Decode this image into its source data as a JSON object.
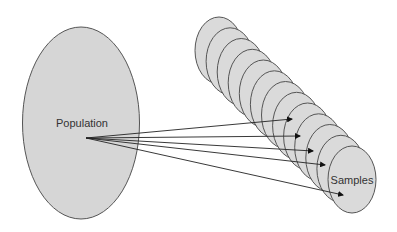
{
  "diagram": {
    "population": {
      "label": "Population",
      "cx": 81,
      "cy": 123,
      "rx": 58.5,
      "ry": 96,
      "fill": "#d6d6d6",
      "stroke": "#555555"
    },
    "samples": {
      "label": "Samples",
      "count": 13,
      "first_center": [
        219,
        50.5
      ],
      "step": [
        11.08,
        10.75
      ],
      "rx": 24,
      "ry": 33.5,
      "fill": "#dadada",
      "stroke": "#555555"
    },
    "arrows": {
      "origin": [
        86,
        138
      ],
      "targets": [
        [
          292,
          119
        ],
        [
          300,
          136
        ],
        [
          313,
          151
        ],
        [
          325,
          165
        ],
        [
          343,
          195
        ]
      ],
      "color": "#222222"
    }
  }
}
